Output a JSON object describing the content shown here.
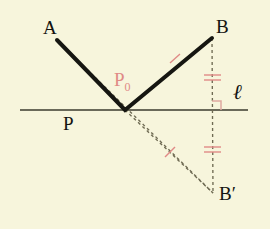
{
  "figure": {
    "background_color": "#f7f5dc",
    "solid_color": "#161611",
    "dashed_color": "#6e6a52",
    "accent_color": "#e08a86"
  },
  "labels": {
    "a": "A",
    "b": "B",
    "p": "P",
    "p_zero_main": "P",
    "p_zero_sub": "0",
    "b_prime": "B′",
    "line_l": "ℓ"
  },
  "points": {
    "A": {
      "x": 57,
      "y": 40,
      "label": "A",
      "label_x": 44,
      "label_y": 20
    },
    "B": {
      "x": 212,
      "y": 38,
      "label": "B",
      "label_x": 216,
      "label_y": 19
    },
    "P0": {
      "x": 125,
      "y": 110,
      "label": "P0",
      "label_x": 114,
      "label_y": 70
    },
    "P": {
      "x": 78,
      "y": 110,
      "label": "P",
      "label_x": 64,
      "label_y": 115
    },
    "Bprime": {
      "x": 213,
      "y": 193,
      "label": "B′",
      "label_x": 220,
      "label_y": 186
    }
  },
  "line_l": {
    "x_start": 20,
    "x_end": 248,
    "y": 110,
    "label": "ℓ",
    "label_x": 234,
    "label_y": 84
  },
  "segments": [
    {
      "name": "segment-a-p0",
      "style": "solid",
      "from": "A",
      "to": "P0"
    },
    {
      "name": "segment-p0-b",
      "style": "solid",
      "from": "P0",
      "to": "B"
    },
    {
      "name": "segment-a-p-bprime",
      "style": "dashed",
      "from": "A",
      "to": "Bprime"
    },
    {
      "name": "segment-p0-bprime",
      "style": "dashed",
      "from": "P0",
      "to": "Bprime"
    },
    {
      "name": "segment-b-bprime-perpendicular",
      "style": "dashed",
      "from": "B",
      "to": "Bprime"
    }
  ],
  "tick_marks": [
    {
      "name": "tick-on-p0-b",
      "kind": "single-slash",
      "x": 175,
      "y": 58
    },
    {
      "name": "tick-on-p0-bprime",
      "kind": "single-slash",
      "x": 170,
      "y": 152
    },
    {
      "name": "tick-upper-perpendicular",
      "kind": "double-bar",
      "x": 212,
      "y": 77
    },
    {
      "name": "tick-lower-perpendicular",
      "kind": "double-bar",
      "x": 212,
      "y": 150
    }
  ],
  "right_angle": {
    "name": "right-angle-marker",
    "x": 212,
    "y": 101,
    "size": 9
  }
}
